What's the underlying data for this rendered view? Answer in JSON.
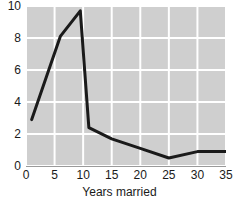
{
  "chart_data": {
    "type": "line",
    "title": "",
    "subtitle": "",
    "xlabel": "Years married",
    "ylabel": "",
    "xlim": [
      0,
      35
    ],
    "ylim": [
      0,
      10
    ],
    "xticks": [
      0,
      5,
      10,
      15,
      20,
      25,
      30,
      35
    ],
    "xtick_labels": [
      "0",
      "5",
      "10",
      "15",
      "20",
      "25",
      "30",
      "35"
    ],
    "yticks": [
      0,
      2,
      4,
      6,
      8,
      10
    ],
    "ytick_labels": [
      "0",
      "2",
      "4",
      "6",
      "8",
      "10"
    ],
    "grid": true,
    "grid_color": "#ffffff",
    "plot_bgcolor": "#cfcfcf",
    "figure_bgcolor": "#ffffff",
    "line_color": "#1a1a1a",
    "line_width": 3,
    "legend": null,
    "annotations": [],
    "x": [
      1,
      6,
      9.5,
      11,
      15,
      20,
      25,
      30,
      35
    ],
    "values": [
      2.9,
      8.1,
      9.7,
      2.4,
      1.7,
      1.1,
      0.5,
      0.9,
      0.9
    ],
    "series": [
      {
        "name": "frequency",
        "x": [
          1,
          6,
          9.5,
          11,
          15,
          20,
          25,
          30,
          35
        ],
        "values": [
          2.9,
          8.1,
          9.7,
          2.4,
          1.7,
          1.1,
          0.5,
          0.9,
          0.9
        ]
      }
    ]
  }
}
